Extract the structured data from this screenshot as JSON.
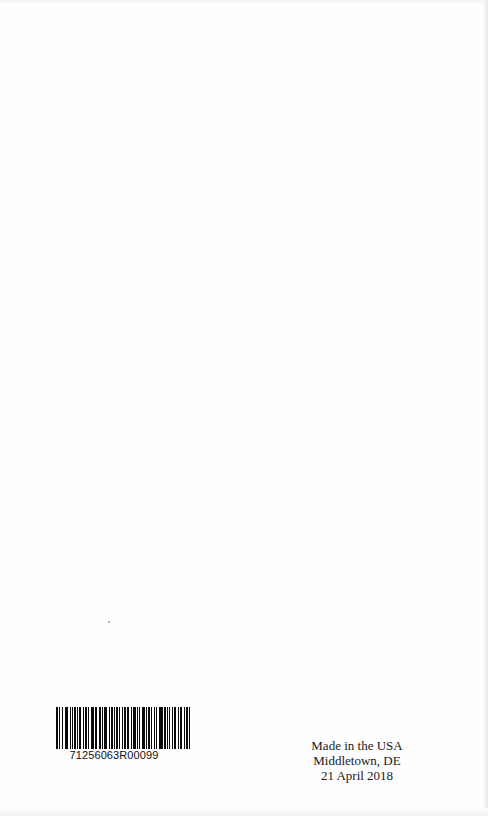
{
  "page": {
    "background": "#fefefe"
  },
  "barcode": {
    "number": "71256063R00099",
    "pattern": [
      2,
      1,
      1,
      2,
      1,
      1,
      3,
      2,
      1,
      1,
      1,
      1,
      2,
      1,
      1,
      1,
      1,
      2,
      1,
      1,
      2,
      1,
      1,
      2,
      3,
      1,
      1,
      2,
      2,
      1,
      1,
      1,
      3,
      2,
      1,
      1,
      1,
      1,
      1,
      1,
      2,
      1,
      1,
      2,
      1,
      1,
      2,
      1,
      1,
      2,
      1,
      1,
      3,
      1,
      1,
      1,
      1,
      2,
      2,
      1,
      1,
      1,
      2,
      1,
      1,
      2,
      1,
      1,
      1,
      2,
      3,
      1,
      2,
      1,
      1,
      1,
      1,
      2,
      1,
      1,
      2,
      1,
      1,
      1,
      2,
      2,
      1,
      1,
      2,
      1,
      1,
      2
    ]
  },
  "imprint": {
    "line1": "Made in the USA",
    "line2": "Middletown, DE",
    "line3": "21 April 2018"
  }
}
